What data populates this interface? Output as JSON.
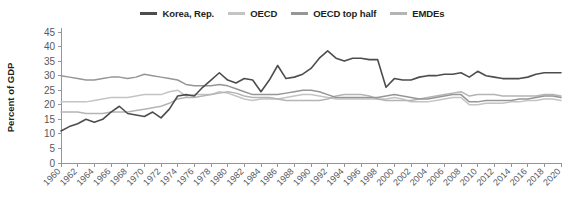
{
  "legend": {
    "position": "top-center",
    "items": [
      {
        "label": "Korea, Rep.",
        "color": "#4d4d4d"
      },
      {
        "label": "OECD",
        "color": "#c4c4c4"
      },
      {
        "label": "OECD top half",
        "color": "#969696"
      },
      {
        "label": "EMDEs",
        "color": "#b4b4b4"
      }
    ]
  },
  "axes": {
    "ylabel": "Percent of GDP",
    "yticks": [
      "0",
      "5",
      "10",
      "15",
      "20",
      "25",
      "30",
      "35",
      "40",
      "45"
    ],
    "xticks": [
      "1960",
      "1962",
      "1964",
      "1966",
      "1968",
      "1970",
      "1972",
      "1974",
      "1976",
      "1978",
      "1980",
      "1982",
      "1984",
      "1986",
      "1988",
      "1990",
      "1992",
      "1994",
      "1996",
      "1998",
      "2000",
      "2002",
      "2004",
      "2006",
      "2008",
      "2010",
      "2012",
      "2014",
      "2016",
      "2018",
      "2020"
    ]
  },
  "chart_data": {
    "type": "line",
    "title": "",
    "xlabel": "",
    "ylabel": "Percent of GDP",
    "ylim": [
      0,
      45
    ],
    "xlim": [
      1960,
      2020
    ],
    "grid": false,
    "legend_position": "top-center",
    "x": [
      1960,
      1961,
      1962,
      1963,
      1964,
      1965,
      1966,
      1967,
      1968,
      1969,
      1970,
      1971,
      1972,
      1973,
      1974,
      1975,
      1976,
      1977,
      1978,
      1979,
      1980,
      1981,
      1982,
      1983,
      1984,
      1985,
      1986,
      1987,
      1988,
      1989,
      1990,
      1991,
      1992,
      1993,
      1994,
      1995,
      1996,
      1997,
      1998,
      1999,
      2000,
      2001,
      2002,
      2003,
      2004,
      2005,
      2006,
      2007,
      2008,
      2009,
      2010,
      2011,
      2012,
      2013,
      2014,
      2015,
      2016,
      2017,
      2018,
      2019,
      2020
    ],
    "series": [
      {
        "name": "Korea, Rep.",
        "color": "#4d4d4d",
        "values": [
          11.0,
          12.5,
          13.5,
          15.0,
          14.0,
          15.0,
          17.5,
          19.5,
          17.0,
          16.5,
          16.0,
          17.5,
          15.5,
          18.5,
          23.0,
          23.5,
          23.0,
          26.0,
          28.5,
          31.0,
          28.5,
          27.5,
          29.0,
          28.5,
          24.5,
          28.5,
          33.5,
          29.0,
          29.5,
          30.5,
          32.5,
          36.0,
          38.5,
          36.0,
          35.0,
          36.0,
          36.0,
          35.5,
          35.5,
          26.0,
          29.0,
          28.5,
          28.5,
          29.5,
          30.0,
          30.0,
          30.5,
          30.5,
          31.0,
          29.5,
          31.5,
          30.0,
          29.5,
          29.0,
          29.0,
          29.0,
          29.5,
          30.5,
          31.0,
          31.0,
          31.0
        ]
      },
      {
        "name": "OECD",
        "color": "#c4c4c4",
        "values": [
          21.0,
          21.0,
          21.0,
          21.0,
          21.5,
          22.0,
          22.5,
          22.5,
          22.5,
          23.0,
          23.5,
          23.5,
          23.5,
          24.5,
          25.0,
          23.0,
          23.5,
          23.5,
          23.5,
          24.5,
          24.0,
          23.0,
          22.0,
          21.5,
          22.0,
          22.0,
          22.0,
          22.5,
          23.0,
          23.5,
          23.5,
          23.0,
          22.5,
          22.0,
          22.0,
          22.0,
          22.0,
          22.0,
          22.0,
          22.0,
          22.5,
          22.0,
          21.0,
          21.0,
          21.0,
          21.5,
          22.0,
          22.5,
          22.5,
          20.0,
          20.0,
          20.5,
          20.5,
          20.5,
          21.0,
          21.0,
          21.5,
          21.5,
          22.0,
          22.0,
          21.5
        ]
      },
      {
        "name": "OECD top half",
        "color": "#969696",
        "values": [
          30.0,
          29.5,
          29.0,
          28.5,
          28.5,
          29.0,
          29.5,
          29.5,
          29.0,
          29.5,
          30.5,
          30.0,
          29.5,
          29.0,
          28.5,
          27.0,
          26.5,
          26.5,
          26.5,
          27.0,
          26.5,
          25.5,
          24.5,
          23.5,
          23.5,
          23.5,
          23.5,
          24.0,
          24.5,
          25.0,
          25.0,
          24.5,
          23.5,
          22.5,
          22.5,
          22.5,
          22.5,
          22.5,
          22.5,
          23.0,
          23.5,
          23.0,
          22.5,
          22.0,
          22.0,
          22.5,
          23.0,
          23.5,
          23.5,
          21.0,
          21.0,
          21.5,
          21.5,
          21.5,
          21.5,
          22.0,
          22.0,
          22.5,
          23.0,
          23.0,
          22.5
        ]
      },
      {
        "name": "EMDEs",
        "color": "#b4b4b4",
        "values": [
          17.5,
          17.5,
          17.5,
          17.0,
          17.0,
          17.0,
          17.5,
          17.5,
          17.5,
          18.0,
          18.5,
          19.0,
          19.5,
          20.5,
          22.0,
          22.5,
          22.5,
          23.0,
          23.5,
          24.0,
          24.5,
          24.0,
          23.0,
          22.5,
          22.5,
          22.5,
          22.0,
          21.5,
          21.5,
          21.5,
          21.5,
          21.5,
          22.0,
          23.0,
          23.5,
          23.5,
          23.5,
          23.0,
          22.0,
          21.5,
          21.5,
          21.5,
          21.5,
          22.0,
          22.5,
          23.0,
          23.5,
          24.0,
          24.5,
          23.0,
          23.5,
          23.5,
          23.5,
          23.0,
          23.0,
          23.0,
          23.0,
          23.0,
          23.5,
          23.5,
          23.0
        ]
      }
    ]
  },
  "geometry": {
    "plot_left": 61,
    "plot_right": 561,
    "y_zero": 163,
    "y_max": 32,
    "x_start_year": 1960,
    "x_end_year": 2020,
    "y_max_value": 45
  }
}
